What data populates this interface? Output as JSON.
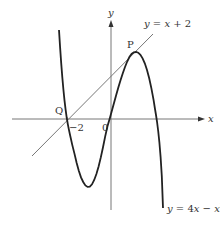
{
  "diagram": {
    "axes": {
      "x_label": "x",
      "y_label": "y",
      "origin_label": "0"
    },
    "curve": {
      "equation_label": "y = 4x − x³",
      "eq_y": "y",
      "eq_eq": " = 4",
      "eq_x": "x",
      "eq_minus": " − ",
      "eq_x2": "x",
      "eq_exp": "3"
    },
    "line": {
      "equation_label": "y = x + 2",
      "eq_y": "y",
      "eq_eq": " = ",
      "eq_x": "x",
      "eq_rest": " + 2"
    },
    "points": [
      {
        "label": "P",
        "description": "tangent point of line and curve"
      },
      {
        "label": "Q",
        "description": "intersection at x = −2"
      }
    ],
    "tick_labels": {
      "x_neg2": "−2"
    },
    "colors": {
      "curve": "#222222",
      "line": "#777777",
      "axes": "#777777"
    }
  }
}
